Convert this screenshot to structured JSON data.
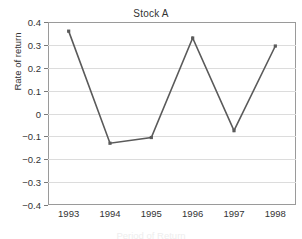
{
  "chart_data": {
    "type": "line",
    "title": "Stock A",
    "xlabel": "Period of Return",
    "ylabel": "Rate of return",
    "categories": [
      "1993",
      "1994",
      "1995",
      "1996",
      "1997",
      "1998"
    ],
    "x": [
      1993,
      1994,
      1995,
      1996,
      1997,
      1998
    ],
    "values": [
      0.36,
      -0.13,
      -0.105,
      0.33,
      -0.075,
      0.295
    ],
    "series": [
      {
        "name": "Stock A",
        "values": [
          0.36,
          -0.13,
          -0.105,
          0.33,
          -0.075,
          0.295
        ]
      }
    ],
    "ylim": [
      -0.4,
      0.4
    ],
    "yticks": [
      0.4,
      0.3,
      0.2,
      0.1,
      0,
      -0.1,
      -0.2,
      -0.3,
      -0.4
    ],
    "ytick_labels": [
      "0.4",
      "0.3",
      "0.2",
      "0.1",
      "0",
      "−0.1",
      "−0.2",
      "−0.3",
      "−0.4"
    ],
    "grid": "horizontal",
    "legend": "none",
    "marker": "square",
    "line_color": "#5a5a5a",
    "marker_color": "#5a5a5a",
    "grid_color": "#dcdcdc",
    "frame_color": "#9a9a9a",
    "text_color": "#333333",
    "background": "#ffffff"
  }
}
